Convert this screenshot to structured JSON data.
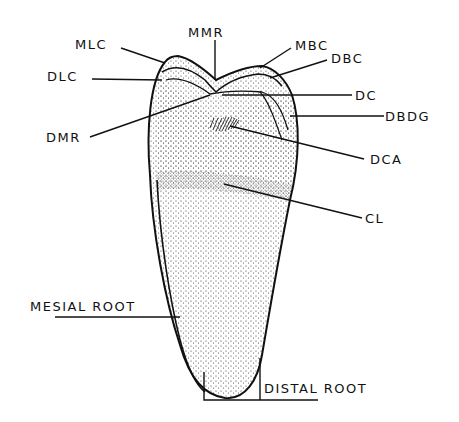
{
  "diagram": {
    "colors": {
      "ink": "#111111",
      "background": "#ffffff",
      "stipple": "#333333"
    },
    "labels": {
      "mlc": "MLC",
      "mmr": "MMR",
      "mbc": "MBC",
      "dbc": "DBC",
      "dlc": "DLC",
      "dc": "DC",
      "dmr": "DMR",
      "dbdg": "DBDG",
      "dca": "DCA",
      "cl": "CL",
      "mesial_root": "MESIAL ROOT",
      "distal_root": "DISTAL ROOT"
    }
  }
}
